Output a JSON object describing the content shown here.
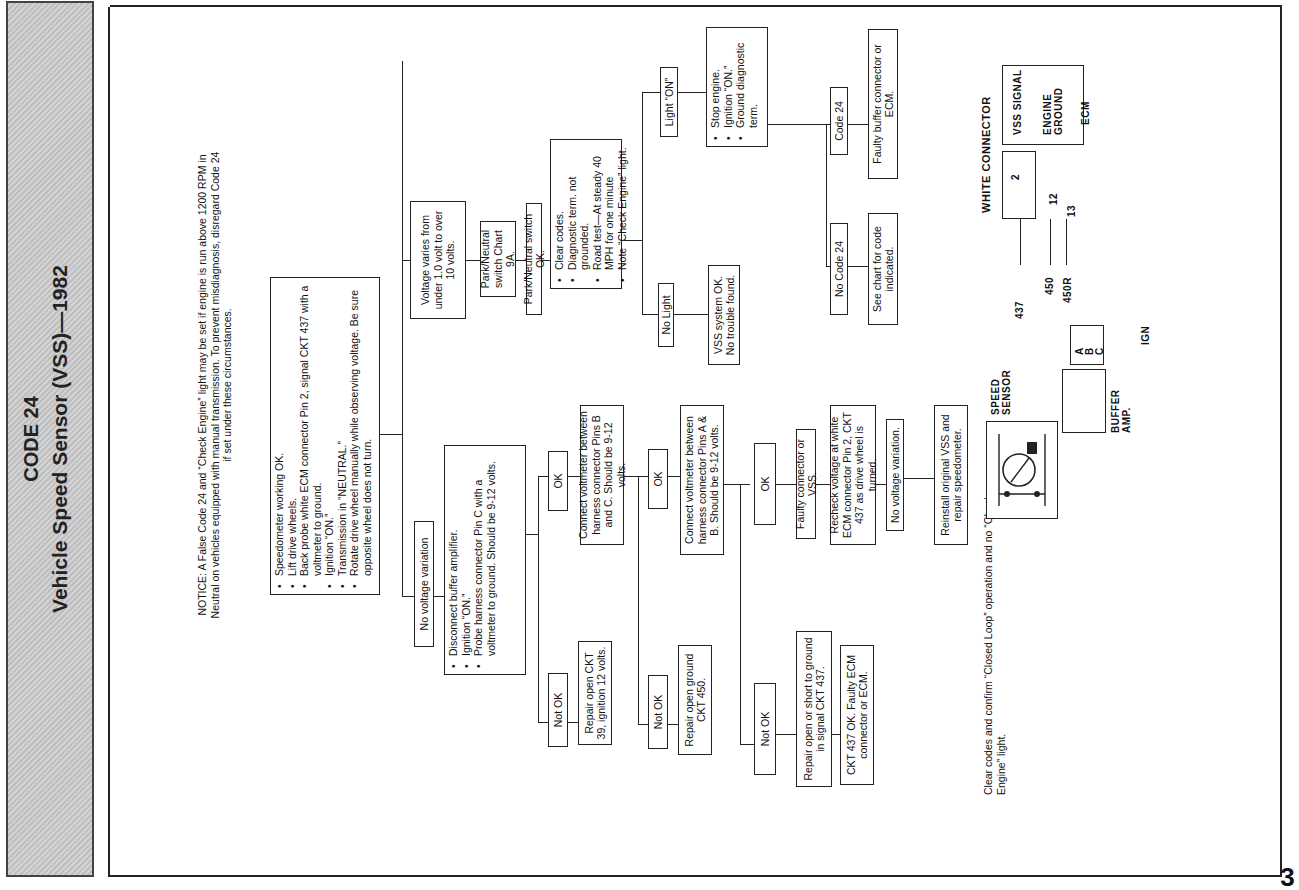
{
  "header": {
    "code": "CODE 24",
    "title": "Vehicle Speed Sensor (VSS)—1982"
  },
  "notice": {
    "line1": "NOTICE: A False Code 24 and “Check Engine” light may be set if engine is run above 1200 RPM in",
    "line2": "Neutral on vehicles equipped with manual transmission. To prevent misdiagnosis, disregard Code 24",
    "line3": "if set under these circumstances."
  },
  "flowchart": {
    "start": {
      "items": [
        "Speedometer working OK.",
        "Lift drive wheels.",
        "Back probe white ECM connector Pin 2, signal CKT 437 with a voltmeter to ground.",
        "Ignition “ON.”",
        "Transmission in “NEUTRAL.”",
        "Rotate drive wheel manually while observing voltage. Be sure opposite wheel does not turn."
      ]
    },
    "voltage_varies": "Voltage varies from under 1.0 volt to over 10 volts.",
    "park_neutral_chart": "Park/Neutral switch Chart 9A.",
    "park_neutral_ok": "Park/Neutral switch OK.",
    "road_test": {
      "items": [
        "Clear codes.",
        "Diagnostic term. not grounded.",
        "Road test—At steady 40 MPH for one minute",
        "Note “Check Engine” light."
      ]
    },
    "light_on": "Light “ON”",
    "no_light": "No Light",
    "vss_ok": "VSS system OK. No trouble found.",
    "stop_engine": {
      "items": [
        "Stop engine.",
        "Ignition “ON.”",
        "Ground diagnostic term."
      ]
    },
    "code_24": "Code 24",
    "no_code_24": "No Code 24",
    "faulty_buffer": "Faulty buffer connector or ECM.",
    "see_chart": "See chart for code indicated.",
    "no_voltage_variation": "No voltage variation",
    "disconnect_buffer": {
      "items": [
        "Disconnect buffer amplifier.",
        "Ignition “ON.”",
        "Probe harness connector Pin C with a voltmeter to ground. Should be 9-12 volts."
      ]
    },
    "ok_1": "OK",
    "not_ok_1": "Not OK",
    "repair_ckt39": "Repair open CKT 39, ignition 12 volts.",
    "connect_bc": "Connect voltmeter between harness connector Pins B and C. Should be 9-12 volts.",
    "ok_2": "OK",
    "not_ok_2": "Not OK",
    "repair_ckt450": "Repair open ground CKT 450.",
    "connect_ab": "Connect voltmeter between harness connector Pins A & B. Should be 9-12 volts.",
    "ok_3": "OK",
    "not_ok_3": "Not OK",
    "faulty_connector_vss": "Faulty connector or VSS.",
    "recheck_voltage": "Recheck voltage at white ECM connector Pin 2, CKT 437 as drive wheel is turned.",
    "no_voltage_variation_2": "No voltage variation.",
    "reinstall_vss": "Reinstall original VSS and repair speedometer.",
    "repair_ckt437": "Repair open or short to ground in signal CKT 437.",
    "ckt437_ok": "CKT 437 OK. Faulty ECM connector or ECM.",
    "closing_note": "Clear codes and confirm “Closed Loop” operation and no “Check Engine” light."
  },
  "wiring": {
    "white_connector": "WHITE CONNECTOR",
    "ecm": "ECM",
    "vss_signal": "VSS SIGNAL",
    "engine_ground": "ENGINE GROUND",
    "pin_2": "2",
    "pin_12": "12",
    "pin_13": "13",
    "wire_437": "437",
    "wire_450": "450",
    "wire_450r": "450R",
    "ign": "IGN",
    "pin_a": "A",
    "pin_b": "B",
    "pin_c": "C",
    "buffer_amp": "BUFFER AMP.",
    "speed_sensor": "SPEED SENSOR"
  },
  "page_number": "3"
}
